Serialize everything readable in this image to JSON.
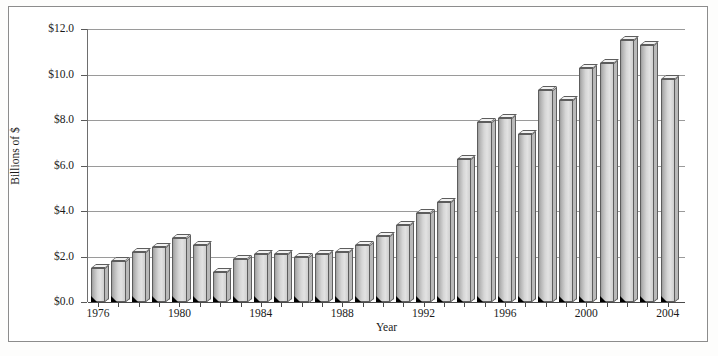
{
  "chart_data": {
    "type": "bar",
    "title": "",
    "xlabel": "Year",
    "ylabel": "Billions of $",
    "ylim": [
      0.0,
      12.0
    ],
    "ytick_labels": [
      "$0.0",
      "$2.0",
      "$4.0",
      "$6.0",
      "$8.0",
      "$10.0",
      "$12.0"
    ],
    "ytick_values": [
      0.0,
      2.0,
      4.0,
      6.0,
      8.0,
      10.0,
      12.0
    ],
    "grid": true,
    "legend": "none",
    "xtick_labels": [
      "1976",
      "1980",
      "1984",
      "1988",
      "1992",
      "1996",
      "2000",
      "2004"
    ],
    "categories": [
      "1976",
      "1977",
      "1978",
      "1979",
      "1980",
      "1981",
      "1982",
      "1983",
      "1984",
      "1985",
      "1986",
      "1987",
      "1988",
      "1989",
      "1990",
      "1991",
      "1992",
      "1993",
      "1994",
      "1995",
      "1996",
      "1997",
      "1998",
      "1999",
      "2000",
      "2001",
      "2002",
      "2003",
      "2004"
    ],
    "values": [
      1.5,
      1.8,
      2.2,
      2.4,
      2.8,
      2.5,
      1.3,
      1.9,
      2.1,
      2.1,
      2.0,
      2.1,
      2.2,
      2.5,
      2.9,
      3.4,
      3.9,
      4.4,
      6.3,
      7.9,
      8.1,
      7.4,
      9.3,
      8.9,
      10.3,
      10.5,
      11.5,
      11.3,
      9.8
    ]
  },
  "figure": {
    "axis_line_color": "#6e6e6e",
    "grid_color": "#9a9a9a",
    "bar_face_color": "#d6d6d6",
    "bar_edge_color": "#5d5d5d",
    "frame_color": "#8c8c8c"
  }
}
